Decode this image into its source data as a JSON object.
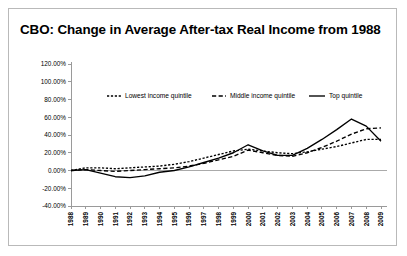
{
  "card": {
    "title": "CBO: Change in Average After-tax Real Income from 1988"
  },
  "chart_data": {
    "type": "line",
    "title": "CBO: Change in Average After-tax Real Income from 1988",
    "xlabel": "",
    "ylabel": "",
    "ylim": [
      -40,
      120
    ],
    "ytick_labels": [
      "120.00%",
      "100.00%",
      "80.00%",
      "60.00%",
      "40.00%",
      "20.00%",
      "0.00%",
      "-20.00%",
      "-40.00%"
    ],
    "ytick_values": [
      120,
      100,
      80,
      60,
      40,
      20,
      0,
      -20,
      -40
    ],
    "grid": false,
    "legend_position": "top",
    "categories": [
      "1988",
      "1989",
      "1990",
      "1991",
      "1992",
      "1993",
      "1994",
      "1995",
      "1996",
      "1997",
      "1998",
      "1999",
      "2000",
      "2001",
      "2002",
      "2003",
      "2004",
      "2005",
      "2006",
      "2007",
      "2008",
      "2009"
    ],
    "series": [
      {
        "name": "Lowest income quintile",
        "style": "fine-dash",
        "values": [
          0,
          3,
          3,
          2,
          3,
          4,
          5,
          7,
          10,
          14,
          18,
          22,
          24,
          22,
          20,
          19,
          21,
          24,
          27,
          31,
          35,
          35
        ]
      },
      {
        "name": "Middle income quintile",
        "style": "dashed",
        "values": [
          0,
          1,
          0,
          -1,
          0,
          1,
          2,
          3,
          5,
          8,
          12,
          16,
          23,
          20,
          17,
          16,
          20,
          26,
          33,
          41,
          47,
          48
        ]
      },
      {
        "name": "Top quintile",
        "style": "solid",
        "values": [
          0,
          1,
          -3,
          -7,
          -8,
          -6,
          -2,
          0,
          4,
          9,
          14,
          20,
          29,
          22,
          17,
          17,
          25,
          35,
          46,
          58,
          50,
          33
        ]
      }
    ]
  },
  "legend": {
    "items": [
      {
        "label": "Lowest income quintile"
      },
      {
        "label": "Middle income quintile"
      },
      {
        "label": "Top quintile"
      }
    ]
  }
}
